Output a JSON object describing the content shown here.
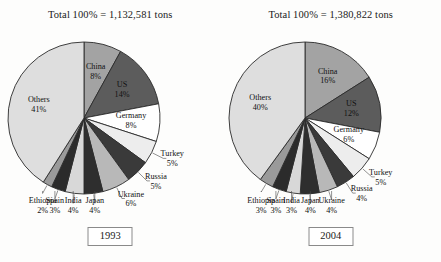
{
  "chart_data": [
    {
      "type": "pie",
      "title": "Total 100% = 1,132,581 tons",
      "year_label": "1993",
      "total_tons": "1,132,581",
      "xlabel": "",
      "ylabel": "",
      "legend": "none (labels on slices)",
      "grid": false,
      "categories": [
        "China",
        "US",
        "Germany",
        "Turkey",
        "Russia",
        "Ukraine",
        "Japan",
        "India",
        "Spain",
        "Ethiopia",
        "Others"
      ],
      "values": [
        8,
        14,
        8,
        5,
        5,
        6,
        4,
        4,
        3,
        2,
        41
      ],
      "slices": [
        {
          "label": "China",
          "value": 8,
          "value_text": "8%",
          "color": "#a3a3a3",
          "placement": "inside"
        },
        {
          "label": "US",
          "value": 14,
          "value_text": "14%",
          "color": "#5c5c5c",
          "placement": "inside"
        },
        {
          "label": "Germany",
          "value": 8,
          "value_text": "8%",
          "color": "#ffffff",
          "placement": "inside"
        },
        {
          "label": "Turkey",
          "value": 5,
          "value_text": "5%",
          "color": "#ededed",
          "placement": "outside"
        },
        {
          "label": "Russia",
          "value": 5,
          "value_text": "5%",
          "color": "#3a3a3a",
          "placement": "outside"
        },
        {
          "label": "Ukraine",
          "value": 6,
          "value_text": "6%",
          "color": "#b8b8b8",
          "placement": "outside"
        },
        {
          "label": "Japan",
          "value": 4,
          "value_text": "4%",
          "color": "#2e2e2e",
          "placement": "below"
        },
        {
          "label": "India",
          "value": 4,
          "value_text": "4%",
          "color": "#d8d8d8",
          "placement": "below"
        },
        {
          "label": "Spain",
          "value": 3,
          "value_text": "3%",
          "color": "#2b2b2b",
          "placement": "below"
        },
        {
          "label": "Ethiopia",
          "value": 2,
          "value_text": "2%",
          "color": "#9a9a9a",
          "placement": "below"
        },
        {
          "label": "Others",
          "value": 41,
          "value_text": "41%",
          "color": "#dedede",
          "placement": "inside"
        }
      ]
    },
    {
      "type": "pie",
      "title": "Total 100% = 1,380,822 tons",
      "year_label": "2004",
      "total_tons": "1,380,822",
      "xlabel": "",
      "ylabel": "",
      "legend": "none (labels on slices)",
      "grid": false,
      "categories": [
        "China",
        "US",
        "Germany",
        "Turkey",
        "Russia",
        "Ukraine",
        "Japan",
        "India",
        "Spain",
        "Ethiopia",
        "Others"
      ],
      "values": [
        16,
        12,
        6,
        5,
        4,
        4,
        4,
        3,
        3,
        3,
        40
      ],
      "slices": [
        {
          "label": "China",
          "value": 16,
          "value_text": "16%",
          "color": "#a3a3a3",
          "placement": "inside"
        },
        {
          "label": "US",
          "value": 12,
          "value_text": "12%",
          "color": "#5c5c5c",
          "placement": "inside"
        },
        {
          "label": "Germany",
          "value": 6,
          "value_text": "6%",
          "color": "#ffffff",
          "placement": "inside"
        },
        {
          "label": "Turkey",
          "value": 5,
          "value_text": "5%",
          "color": "#ededed",
          "placement": "outside"
        },
        {
          "label": "Russia",
          "value": 4,
          "value_text": "4%",
          "color": "#3a3a3a",
          "placement": "outside"
        },
        {
          "label": "Ukraine",
          "value": 4,
          "value_text": "4%",
          "color": "#b8b8b8",
          "placement": "below"
        },
        {
          "label": "Japan",
          "value": 4,
          "value_text": "4%",
          "color": "#2e2e2e",
          "placement": "below"
        },
        {
          "label": "India",
          "value": 3,
          "value_text": "3%",
          "color": "#d8d8d8",
          "placement": "below"
        },
        {
          "label": "Spain",
          "value": 3,
          "value_text": "3%",
          "color": "#2b2b2b",
          "placement": "below"
        },
        {
          "label": "Ethiopia",
          "value": 3,
          "value_text": "3%",
          "color": "#9a9a9a",
          "placement": "below"
        },
        {
          "label": "Others",
          "value": 40,
          "value_text": "40%",
          "color": "#dedede",
          "placement": "inside"
        }
      ]
    }
  ],
  "style": {
    "stroke": "#2b2b2b",
    "background": "#fdfdfc",
    "text": "#1a1a1a"
  }
}
